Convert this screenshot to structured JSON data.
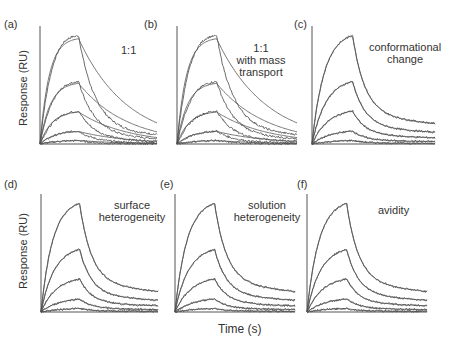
{
  "chart_data": {
    "type": "line",
    "title": "",
    "xlabel": "Time (s)",
    "ylabel": "Response (RU)",
    "grid": false,
    "legend": "none",
    "panels": [
      {
        "id": "a",
        "label": "(a)",
        "model": "1:1",
        "fit_quality": "poor",
        "peaks_rel": [
          0.92,
          0.53,
          0.28,
          0.11,
          0.03
        ]
      },
      {
        "id": "b",
        "label": "(b)",
        "model": "1:1 with mass transport",
        "fit_quality": "poor",
        "peaks_rel": [
          0.92,
          0.53,
          0.28,
          0.11,
          0.03
        ]
      },
      {
        "id": "c",
        "label": "(c)",
        "model": "conformational change",
        "fit_quality": "good",
        "peaks_rel": [
          0.92,
          0.53,
          0.28,
          0.11,
          0.03
        ]
      },
      {
        "id": "d",
        "label": "(d)",
        "model": "surface heterogeneity",
        "fit_quality": "good",
        "peaks_rel": [
          0.92,
          0.53,
          0.28,
          0.11,
          0.03
        ]
      },
      {
        "id": "e",
        "label": "(e)",
        "model": "solution heterogeneity",
        "fit_quality": "good",
        "peaks_rel": [
          0.92,
          0.53,
          0.28,
          0.11,
          0.03
        ]
      },
      {
        "id": "f",
        "label": "(f)",
        "model": "avidity",
        "fit_quality": "good",
        "peaks_rel": [
          0.92,
          0.53,
          0.28,
          0.11,
          0.03
        ]
      }
    ]
  },
  "labels": {
    "a": "(a)",
    "b": "(b)",
    "c": "(c)",
    "d": "(d)",
    "e": "(e)",
    "f": "(f)",
    "model_a": "1:1",
    "model_b_1": "1:1",
    "model_b_2": "with mass",
    "model_b_3": "transport",
    "model_c_1": "conformational",
    "model_c_2": "change",
    "model_d_1": "surface",
    "model_d_2": "heterogeneity",
    "model_e_1": "solution",
    "model_e_2": "heterogeneity",
    "model_f": "avidity",
    "ylabel_top": "Response (RU)",
    "ylabel_bottom": "Response (RU)",
    "xlabel": "Time (s)"
  }
}
